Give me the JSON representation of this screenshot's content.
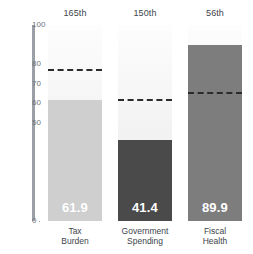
{
  "chart_data": {
    "type": "bar",
    "title": "",
    "subtitle": "",
    "xlabel": "",
    "ylabel": "",
    "ylim": [
      0,
      100
    ],
    "grid": false,
    "legend": "none",
    "categories": [
      "Tax Burden",
      "Government Spending",
      "Fiscal Health"
    ],
    "category_lines": [
      [
        "Tax",
        "Burden"
      ],
      [
        "Government",
        "Spending"
      ],
      [
        "Fiscal",
        "Health"
      ]
    ],
    "values": [
      61.9,
      41.4,
      89.9
    ],
    "value_labels": [
      "61.9",
      "41.4",
      "89.9"
    ],
    "ranks": [
      "165th",
      "150th",
      "56th"
    ],
    "reference_lines": [
      77.5,
      62.5,
      66.0
    ],
    "bar_colors": [
      "#cfcfcf",
      "#4a4a4a",
      "#7d7d7d"
    ],
    "yticks": [
      0,
      50,
      60,
      70,
      80,
      100
    ],
    "ytick_labels": [
      "0",
      "50",
      "60",
      "70",
      "80",
      "100"
    ],
    "reference_line_color": "#2b2b2b",
    "axis_color": "#9aa0a6",
    "value_label_color": "#ffffff",
    "text_color": "#3d444b"
  }
}
